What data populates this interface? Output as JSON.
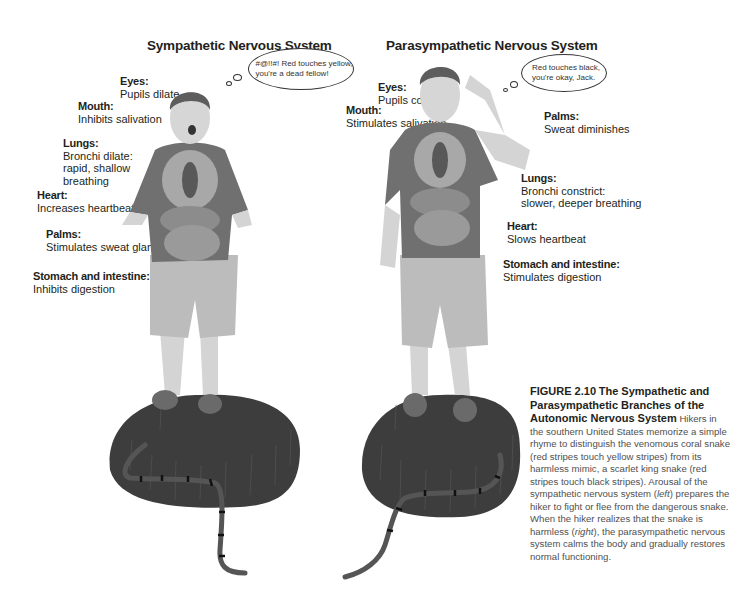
{
  "figure": {
    "left_panel": {
      "title": "Sympathetic Nervous System",
      "thought_bubble": [
        "#@!!#! Red touches yellow,",
        "you're a dead fellow!"
      ],
      "labels": [
        {
          "heading": "Eyes:",
          "text": [
            "Pupils dilate"
          ]
        },
        {
          "heading": "Mouth:",
          "text": [
            "Inhibits salivation"
          ]
        },
        {
          "heading": "Lungs:",
          "text": [
            "Bronchi dilate:",
            "rapid, shallow",
            "breathing"
          ]
        },
        {
          "heading": "Heart:",
          "text": [
            "Increases heartbeat"
          ]
        },
        {
          "heading": "Palms:",
          "text": [
            "Stimulates sweat glands"
          ]
        },
        {
          "heading": "Stomach and intestine:",
          "text": [
            "Inhibits digestion"
          ]
        }
      ],
      "illustration": "startled-hiker-with-visible-organs-standing-on-grass-near-coral-snake"
    },
    "right_panel": {
      "title": "Parasympathetic Nervous System",
      "thought_bubble": [
        "Red touches black,",
        "you're okay, Jack."
      ],
      "labels": [
        {
          "heading": "Eyes:",
          "text": [
            "Pupils contract"
          ]
        },
        {
          "heading": "Mouth:",
          "text": [
            "Stimulates salivation"
          ]
        },
        {
          "heading": "Palms:",
          "text": [
            "Sweat diminishes"
          ]
        },
        {
          "heading": "Lungs:",
          "text": [
            "Bronchi constrict:",
            "slower, deeper breathing"
          ]
        },
        {
          "heading": "Heart:",
          "text": [
            "Slows heartbeat"
          ]
        },
        {
          "heading": "Stomach and intestine:",
          "text": [
            "Stimulates digestion"
          ]
        }
      ],
      "illustration": "relieved-hiker-with-visible-organs-standing-on-grass-near-king-snake"
    },
    "caption": {
      "label": "FIGURE 2.10",
      "title": "The Sympathetic and Parasympathetic Branches of the Autonomic Nervous System",
      "body_parts": [
        {
          "text": "Hikers in the southern United States memorize a simple rhyme to distinguish the venomous coral snake (red stripes touch yellow stripes) from its harmless mimic, a scarlet king snake (red stripes touch black stripes). Arousal of the sympathetic nervous system (",
          "italic": false
        },
        {
          "text": "left",
          "italic": true
        },
        {
          "text": ") prepares the hiker to fight or flee from the dangerous snake. When the hiker realizes that the snake is harmless (",
          "italic": false
        },
        {
          "text": "right",
          "italic": true
        },
        {
          "text": "), the parasympathetic nervous system calms the body and gradually restores normal functioning.",
          "italic": false
        }
      ]
    },
    "colors": {
      "text": "#231f20",
      "caption_body": "#505050",
      "grass": "#3a3a3a",
      "shirt": "#6b6b6b",
      "shorts": "#bdbdbd",
      "skin": "#d9d9d9"
    }
  }
}
